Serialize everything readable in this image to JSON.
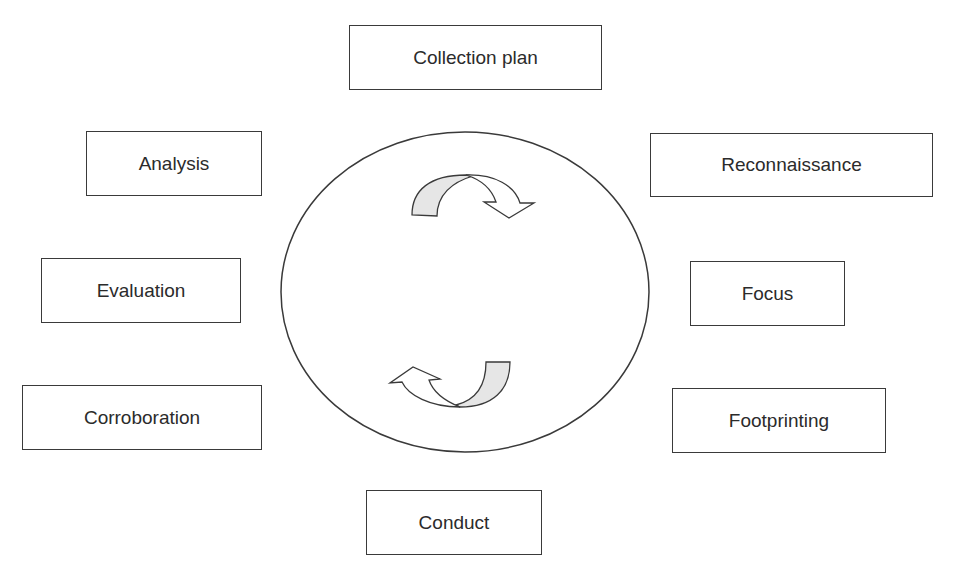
{
  "diagram": {
    "type": "cycle",
    "center": {
      "shape": "ellipse",
      "arrows": [
        "clockwise-top-arrow",
        "clockwise-bottom-arrow"
      ]
    },
    "colors": {
      "stroke": "#3a3a3a",
      "arrow_fill": "#e6e6e6",
      "background": "#ffffff"
    },
    "nodes": [
      {
        "id": "collection-plan",
        "label": "Collection plan"
      },
      {
        "id": "reconnaissance",
        "label": "Reconnaissance"
      },
      {
        "id": "focus",
        "label": "Focus"
      },
      {
        "id": "footprinting",
        "label": "Footprinting"
      },
      {
        "id": "conduct",
        "label": "Conduct"
      },
      {
        "id": "corroboration",
        "label": "Corroboration"
      },
      {
        "id": "evaluation",
        "label": "Evaluation"
      },
      {
        "id": "analysis",
        "label": "Analysis"
      }
    ]
  }
}
